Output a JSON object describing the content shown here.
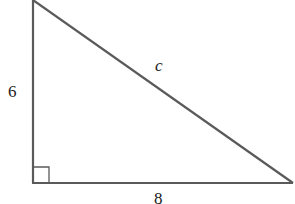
{
  "diagram": {
    "type": "right-triangle",
    "stroke_color": "#5a5a5a",
    "labels": {
      "vertical_leg": "6",
      "horizontal_leg": "8",
      "hypotenuse": "c"
    },
    "right_angle_marker": true
  }
}
